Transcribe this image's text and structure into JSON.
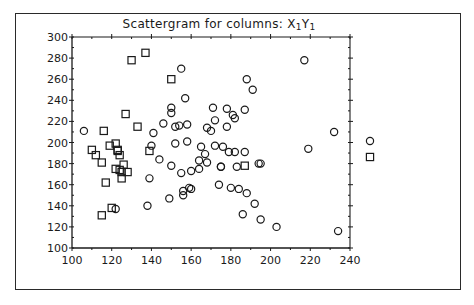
{
  "chart_data": {
    "type": "scatter",
    "title_parts": {
      "prefix": "Scattergram for columns:",
      "x_var": "X",
      "x_sub": "1",
      "y_var": "Y",
      "y_sub": "1"
    },
    "xlabel": "",
    "ylabel": "",
    "xlim": [
      100,
      240
    ],
    "ylim": [
      100,
      300
    ],
    "x_ticks": [
      100,
      120,
      140,
      160,
      180,
      200,
      220,
      240
    ],
    "y_ticks": [
      100,
      120,
      140,
      160,
      180,
      200,
      220,
      240,
      260,
      280,
      300
    ],
    "grid": false,
    "legend": {
      "position": "right",
      "entries": [
        {
          "marker": "circle",
          "label": ""
        },
        {
          "marker": "square",
          "label": ""
        }
      ]
    },
    "series": [
      {
        "name": "circle",
        "marker": "circle",
        "points": [
          [
            106,
            211
          ],
          [
            122,
            137
          ],
          [
            139,
            166
          ],
          [
            141,
            209
          ],
          [
            140,
            197
          ],
          [
            146,
            218
          ],
          [
            138,
            140
          ],
          [
            144,
            184
          ],
          [
            149,
            147
          ],
          [
            150,
            178
          ],
          [
            150,
            233
          ],
          [
            150,
            228
          ],
          [
            152,
            199
          ],
          [
            152,
            215
          ],
          [
            154,
            216
          ],
          [
            155,
            270
          ],
          [
            155,
            171
          ],
          [
            156,
            150
          ],
          [
            156,
            154
          ],
          [
            157,
            242
          ],
          [
            158,
            201
          ],
          [
            158,
            217
          ],
          [
            159,
            157
          ],
          [
            160,
            156
          ],
          [
            160,
            173
          ],
          [
            164,
            183
          ],
          [
            164,
            175
          ],
          [
            165,
            196
          ],
          [
            167,
            189
          ],
          [
            168,
            181
          ],
          [
            168,
            214
          ],
          [
            170,
            211
          ],
          [
            171,
            233
          ],
          [
            172,
            197
          ],
          [
            172,
            221
          ],
          [
            174,
            160
          ],
          [
            175,
            177
          ],
          [
            175,
            177
          ],
          [
            176,
            196
          ],
          [
            178,
            215
          ],
          [
            178,
            232
          ],
          [
            179,
            191
          ],
          [
            180,
            157
          ],
          [
            181,
            226
          ],
          [
            182,
            223
          ],
          [
            182,
            191
          ],
          [
            183,
            177
          ],
          [
            184,
            156
          ],
          [
            186,
            132
          ],
          [
            187,
            231
          ],
          [
            187,
            191
          ],
          [
            188,
            260
          ],
          [
            188,
            152
          ],
          [
            191,
            250
          ],
          [
            192,
            142
          ],
          [
            194,
            180
          ],
          [
            195,
            127
          ],
          [
            195,
            180
          ],
          [
            203,
            120
          ],
          [
            217,
            278
          ],
          [
            219,
            194
          ],
          [
            232,
            210
          ],
          [
            234,
            116
          ],
          [
            248,
            203
          ]
        ]
      },
      {
        "name": "square",
        "marker": "square",
        "points": [
          [
            110,
            193
          ],
          [
            112,
            188
          ],
          [
            115,
            181
          ],
          [
            115,
            131
          ],
          [
            116,
            211
          ],
          [
            117,
            162
          ],
          [
            119,
            197
          ],
          [
            120,
            138
          ],
          [
            122,
            199
          ],
          [
            122,
            175
          ],
          [
            123,
            193
          ],
          [
            123,
            192
          ],
          [
            124,
            188
          ],
          [
            124,
            174
          ],
          [
            125,
            166
          ],
          [
            125,
            172
          ],
          [
            126,
            179
          ],
          [
            127,
            227
          ],
          [
            128,
            172
          ],
          [
            130,
            278
          ],
          [
            133,
            215
          ],
          [
            137,
            285
          ],
          [
            139,
            192
          ],
          [
            150,
            260
          ],
          [
            187,
            178
          ],
          [
            248,
            187
          ]
        ]
      }
    ]
  }
}
